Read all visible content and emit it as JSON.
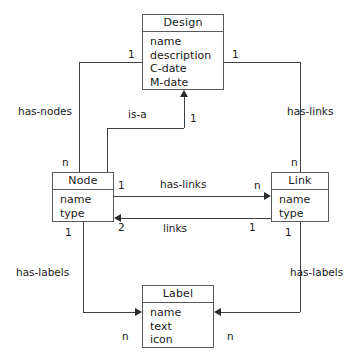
{
  "diagram": {
    "type": "entity-relationship",
    "entities": [
      {
        "id": "design",
        "name": "Design",
        "attributes": [
          "name",
          "description",
          "C-date",
          "M-date"
        ]
      },
      {
        "id": "node",
        "name": "Node",
        "attributes": [
          "name",
          "type"
        ]
      },
      {
        "id": "link",
        "name": "Link",
        "attributes": [
          "name",
          "type"
        ]
      },
      {
        "id": "label",
        "name": "Label",
        "attributes": [
          "name",
          "text",
          "icon"
        ]
      }
    ],
    "relationships": [
      {
        "id": "has-nodes",
        "label": "has-nodes",
        "from": "design",
        "to": "node",
        "from_cardinality": "1",
        "to_cardinality": "n"
      },
      {
        "id": "has-links-design",
        "label": "has-links",
        "from": "design",
        "to": "link",
        "from_cardinality": "1",
        "to_cardinality": "n"
      },
      {
        "id": "is-a",
        "label": "is-a",
        "from": "node",
        "to": "design",
        "from_cardinality": "",
        "to_cardinality": "1"
      },
      {
        "id": "has-links-node",
        "label": "has-links",
        "from": "node",
        "to": "link",
        "from_cardinality": "1",
        "to_cardinality": "n"
      },
      {
        "id": "links",
        "label": "links",
        "from": "link",
        "to": "node",
        "from_cardinality": "1",
        "to_cardinality": "2"
      },
      {
        "id": "has-labels-node",
        "label": "has-labels",
        "from": "node",
        "to": "label",
        "from_cardinality": "1",
        "to_cardinality": "n"
      },
      {
        "id": "has-labels-link",
        "label": "has-labels",
        "from": "link",
        "to": "label",
        "from_cardinality": "1",
        "to_cardinality": "n"
      }
    ],
    "cardinality_markers": {
      "design_left": "1",
      "design_right": "1",
      "design_bottom_isa": "1",
      "node_top": "n",
      "link_top": "n",
      "node_right_top": "1",
      "link_left_top": "n",
      "node_right_bottom": "2",
      "link_left_bottom": "1",
      "node_bottom": "1",
      "link_bottom": "1",
      "label_left": "n",
      "label_right": "n"
    }
  }
}
